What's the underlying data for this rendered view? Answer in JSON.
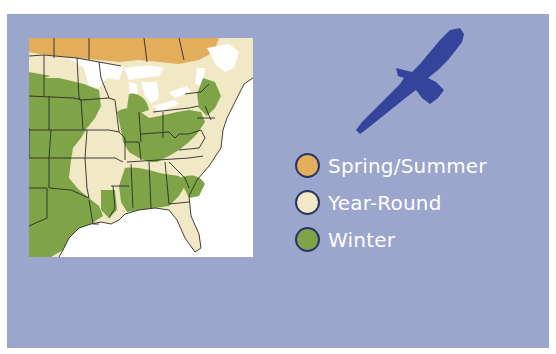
{
  "colors": {
    "panel_background": "#9aa6cc",
    "bird": "#34449a",
    "spring_summer": "#e2ae5c",
    "year_round": "#f1e8c6",
    "winter": "#7ea447",
    "swatch_border": "#2a3566",
    "water_land": "#ffffff"
  },
  "map": {
    "label": "Range map of eastern United States"
  },
  "icons": {
    "bird": "soaring-bird-silhouette"
  },
  "legend": {
    "items": [
      {
        "label": "Spring/Summer",
        "color": "#e2ae5c"
      },
      {
        "label": "Year-Round",
        "color": "#f1e8c6"
      },
      {
        "label": "Winter",
        "color": "#7ea447"
      }
    ]
  }
}
